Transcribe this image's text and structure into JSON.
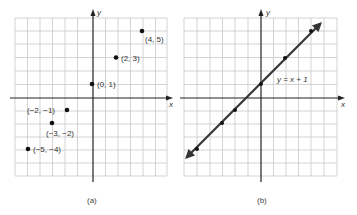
{
  "panel_a": {
    "caption": "(a)",
    "x_axis_label": "x",
    "y_axis_label": "y",
    "points": [
      {
        "x": 4,
        "y": 5,
        "label": "(4, 5)"
      },
      {
        "x": 2,
        "y": 3,
        "label": "(2, 3)"
      },
      {
        "x": 0,
        "y": 1,
        "label": "(0, 1)"
      },
      {
        "x": -2,
        "y": -1,
        "label": "(−2, −1)"
      },
      {
        "x": -3,
        "y": -2,
        "label": "(−3, −2)"
      },
      {
        "x": -5,
        "y": -4,
        "label": "(−5, −4)"
      }
    ]
  },
  "panel_b": {
    "caption": "(b)",
    "x_axis_label": "x",
    "y_axis_label": "y",
    "equation": "y = x + 1",
    "points": [
      {
        "x": 4,
        "y": 5
      },
      {
        "x": 2,
        "y": 3
      },
      {
        "x": 0,
        "y": 1
      },
      {
        "x": -2,
        "y": -1
      },
      {
        "x": -3,
        "y": -2
      },
      {
        "x": -5,
        "y": -4
      }
    ]
  },
  "colors": {
    "grid": "#c8c8c8",
    "axis": "#222222",
    "line": "#333333"
  }
}
